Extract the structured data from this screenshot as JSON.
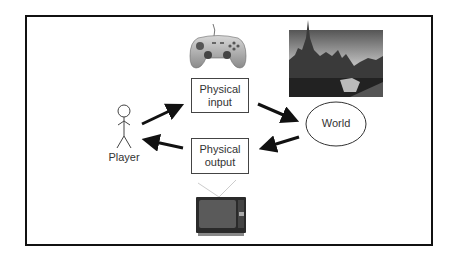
{
  "diagram": {
    "title": "",
    "nodes": {
      "player": {
        "label": "Player",
        "icon": "stick-figure-icon"
      },
      "physical_input": {
        "line1": "Physical",
        "line2": "input",
        "image": "gamepad-icon"
      },
      "physical_output": {
        "line1": "Physical",
        "line2": "output",
        "image": "television-icon"
      },
      "world": {
        "label": "World",
        "image": "city-canal-photo"
      }
    },
    "edges": [
      {
        "from": "Player",
        "to": "Physical input"
      },
      {
        "from": "Physical input",
        "to": "World"
      },
      {
        "from": "World",
        "to": "Physical output"
      },
      {
        "from": "Physical output",
        "to": "Player"
      }
    ]
  },
  "colors": {
    "frame": "#111111",
    "arrow": "#111111",
    "box_border": "#444444",
    "text": "#333333"
  }
}
